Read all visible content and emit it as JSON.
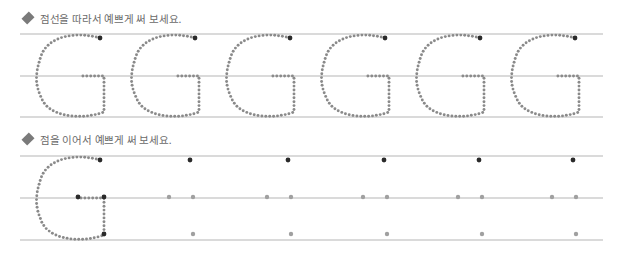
{
  "colors": {
    "guide_line": "#b5b5b5",
    "trace_dot": "#8a8a8a",
    "start_dot": "#2a2a2a",
    "connect_dot": "#a0a0a0",
    "instruction_text": "#6a6a6a",
    "bullet": "#7a7a7a"
  },
  "section1": {
    "instruction": "점선을 따라서 예쁘게 써 보세요.",
    "bullet_icon": "diamond-icon",
    "letter": "G",
    "lines_y": [
      34,
      76,
      117
    ],
    "line_x": [
      20,
      603
    ],
    "letter_origins_x": [
      38,
      133,
      228,
      323,
      418,
      513
    ],
    "count": 6
  },
  "section2": {
    "instruction": "점을 이어서 예쁘게 써 보세요.",
    "bullet_icon": "diamond-icon",
    "letter": "G",
    "lines_y": [
      156,
      198,
      240
    ],
    "line_x": [
      20,
      603
    ],
    "traced_letter_origin_x": 38,
    "dot_sets_x": [
      190,
      288,
      384,
      479,
      573
    ],
    "dot_sets_count": 5
  }
}
